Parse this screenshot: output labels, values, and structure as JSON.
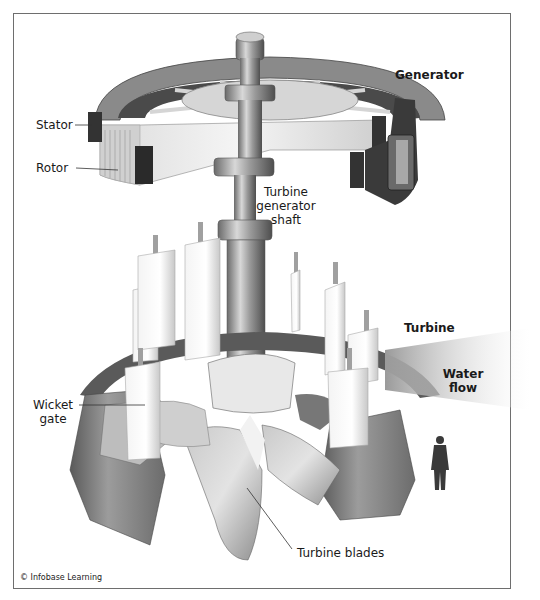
{
  "diagram": {
    "labels": {
      "generator": "Generator",
      "stator": "Stator",
      "rotor": "Rotor",
      "shaft_line1": "Turbine",
      "shaft_line2": "generator",
      "shaft_line3": "shaft",
      "turbine": "Turbine",
      "water_flow_line1": "Water",
      "water_flow_line2": "flow",
      "wicket_gate_line1": "Wicket",
      "wicket_gate_line2": "gate",
      "turbine_blades": "Turbine blades"
    },
    "credit": "© Infobase Learning",
    "colors": {
      "frame_border": "#6e6e6e",
      "metal_light": "#e6e6e6",
      "metal_mid": "#a8a8a8",
      "metal_dark": "#555555",
      "label_text": "#1a1a1a"
    }
  }
}
